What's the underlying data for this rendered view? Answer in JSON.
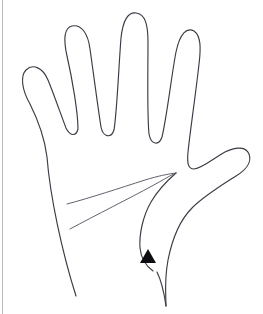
{
  "image": {
    "title": "Hand outline line drawing with triangular pointer marker",
    "width": 263,
    "height": 314,
    "background_color": "#ffffff",
    "stroke_color": "#3b3b46",
    "marker_color": "#0d0d12",
    "edge_rule_color": "#b9babc",
    "subject": "open left hand, palm facing viewer",
    "style": "thin single-weight contour line art, no shading"
  },
  "shapes": {
    "hand_outline_name": "hand-outline",
    "palm_crease_upper_name": "palm-crease-upper",
    "palm_crease_lower_name": "palm-crease-lower",
    "thumb_crease_name": "thumb-base-crease",
    "marker_name": "triangle-pointer-marker"
  },
  "parts": [
    {
      "id": "pinky",
      "label": "pinky finger",
      "tip_x": 28,
      "tip_y": 96
    },
    {
      "id": "ring",
      "label": "ring finger",
      "tip_x": 62,
      "tip_y": 34
    },
    {
      "id": "middle",
      "label": "middle finger",
      "tip_x": 131,
      "tip_y": 14
    },
    {
      "id": "index",
      "label": "index finger",
      "tip_x": 180,
      "tip_y": 31
    },
    {
      "id": "thumb",
      "label": "thumb",
      "tip_x": 247,
      "tip_y": 152
    },
    {
      "id": "palm",
      "label": "palm",
      "tip_x": 110,
      "tip_y": 200
    },
    {
      "id": "wrist",
      "label": "wrist",
      "tip_x": 120,
      "tip_y": 300
    }
  ],
  "marker": {
    "label": "triangle pointer",
    "shape": "filled triangle pointing up",
    "color": "#0d0d12",
    "x": 140,
    "y": 249,
    "width": 16,
    "height": 14
  },
  "geometry": {
    "hand_path": "M 76 296 C 62 252 50 196 47 157 C 44 133 36 116 30 104 C 22 90 20 76 26 70 C 33 63 43 68 48 80 C 53 92 60 112 66 128 C 70 136 76 137 78 129 C 78 112 72 78 67 56 C 63 38 64 28 72 26 C 81 24 88 33 90 49 C 93 70 98 108 101 127 C 103 137 111 139 114 130 C 117 112 119 62 121 38 C 123 20 128 12 136 13 C 145 14 148 24 148 42 C 148 70 147 114 149 134 C 151 145 159 146 162 137 C 167 116 172 72 176 52 C 180 33 187 27 194 31 C 201 36 201 48 199 64 C 196 92 190 132 188 152 C 187 163 188 169 194 169 C 203 168 214 158 225 152 C 237 146 246 147 249 154 C 252 162 246 170 236 176 C 222 185 204 196 192 208 C 178 222 172 240 168 260 C 164 282 166 296 166 306",
    "thumb_inner_path": "M 176 173 C 168 180 158 190 151 202 C 143 216 139 234 140 248 C 141 258 146 266 153 271",
    "crease_upper_path": "M 67 204 C 90 198 120 188 145 180 C 158 176 168 174 176 173",
    "crease_lower_path": "M 70 229 C 96 215 130 198 152 186 C 163 180 171 175 176 173",
    "wrist_right_path": "M 166 306 C 164 292 161 280 157 272"
  }
}
